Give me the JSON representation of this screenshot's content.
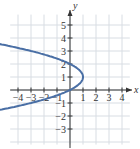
{
  "chart_data": {
    "type": "line",
    "title": "",
    "xlabel": "x",
    "ylabel": "y",
    "xlim": [
      -4.6,
      4.8
    ],
    "ylim": [
      -4.3,
      6.3
    ],
    "grid": true,
    "legend": null,
    "x_ticks": [
      -4,
      -3,
      -2,
      -1,
      1,
      2,
      3,
      4
    ],
    "y_ticks": [
      -3,
      -2,
      -1,
      1,
      2,
      3,
      4,
      5
    ],
    "x_tick_labels": [
      "−4",
      "−3",
      "−2",
      "−1",
      "1",
      "2",
      "3",
      "4"
    ],
    "y_tick_labels": [
      "−3",
      "−2",
      "−1",
      "1",
      "2",
      "3",
      "4",
      "5"
    ],
    "series": [
      {
        "name": "parabola x = -(y-1)^2 + 1",
        "color": "#4a6fa5",
        "arrows": "both",
        "points": [
          {
            "x": -4.4,
            "y": 5.65
          },
          {
            "x": -3,
            "y": 5
          },
          {
            "x": 0,
            "y": 3
          },
          {
            "x": 0.75,
            "y": 2.5
          },
          {
            "x": 1,
            "y": 1
          },
          {
            "x": 0.75,
            "y": -0.5
          },
          {
            "x": 0,
            "y": -1
          },
          {
            "x": -3,
            "y": -3
          },
          {
            "x": -4.4,
            "y": -3.65
          }
        ]
      }
    ],
    "marked_points": [
      {
        "x": 0,
        "y": 3
      },
      {
        "x": 0,
        "y": -1
      },
      {
        "x": 1,
        "y": 1
      }
    ]
  },
  "colors": {
    "grid": "#d8dde3",
    "axis": "#333333",
    "curve": "#4a6fa5"
  }
}
